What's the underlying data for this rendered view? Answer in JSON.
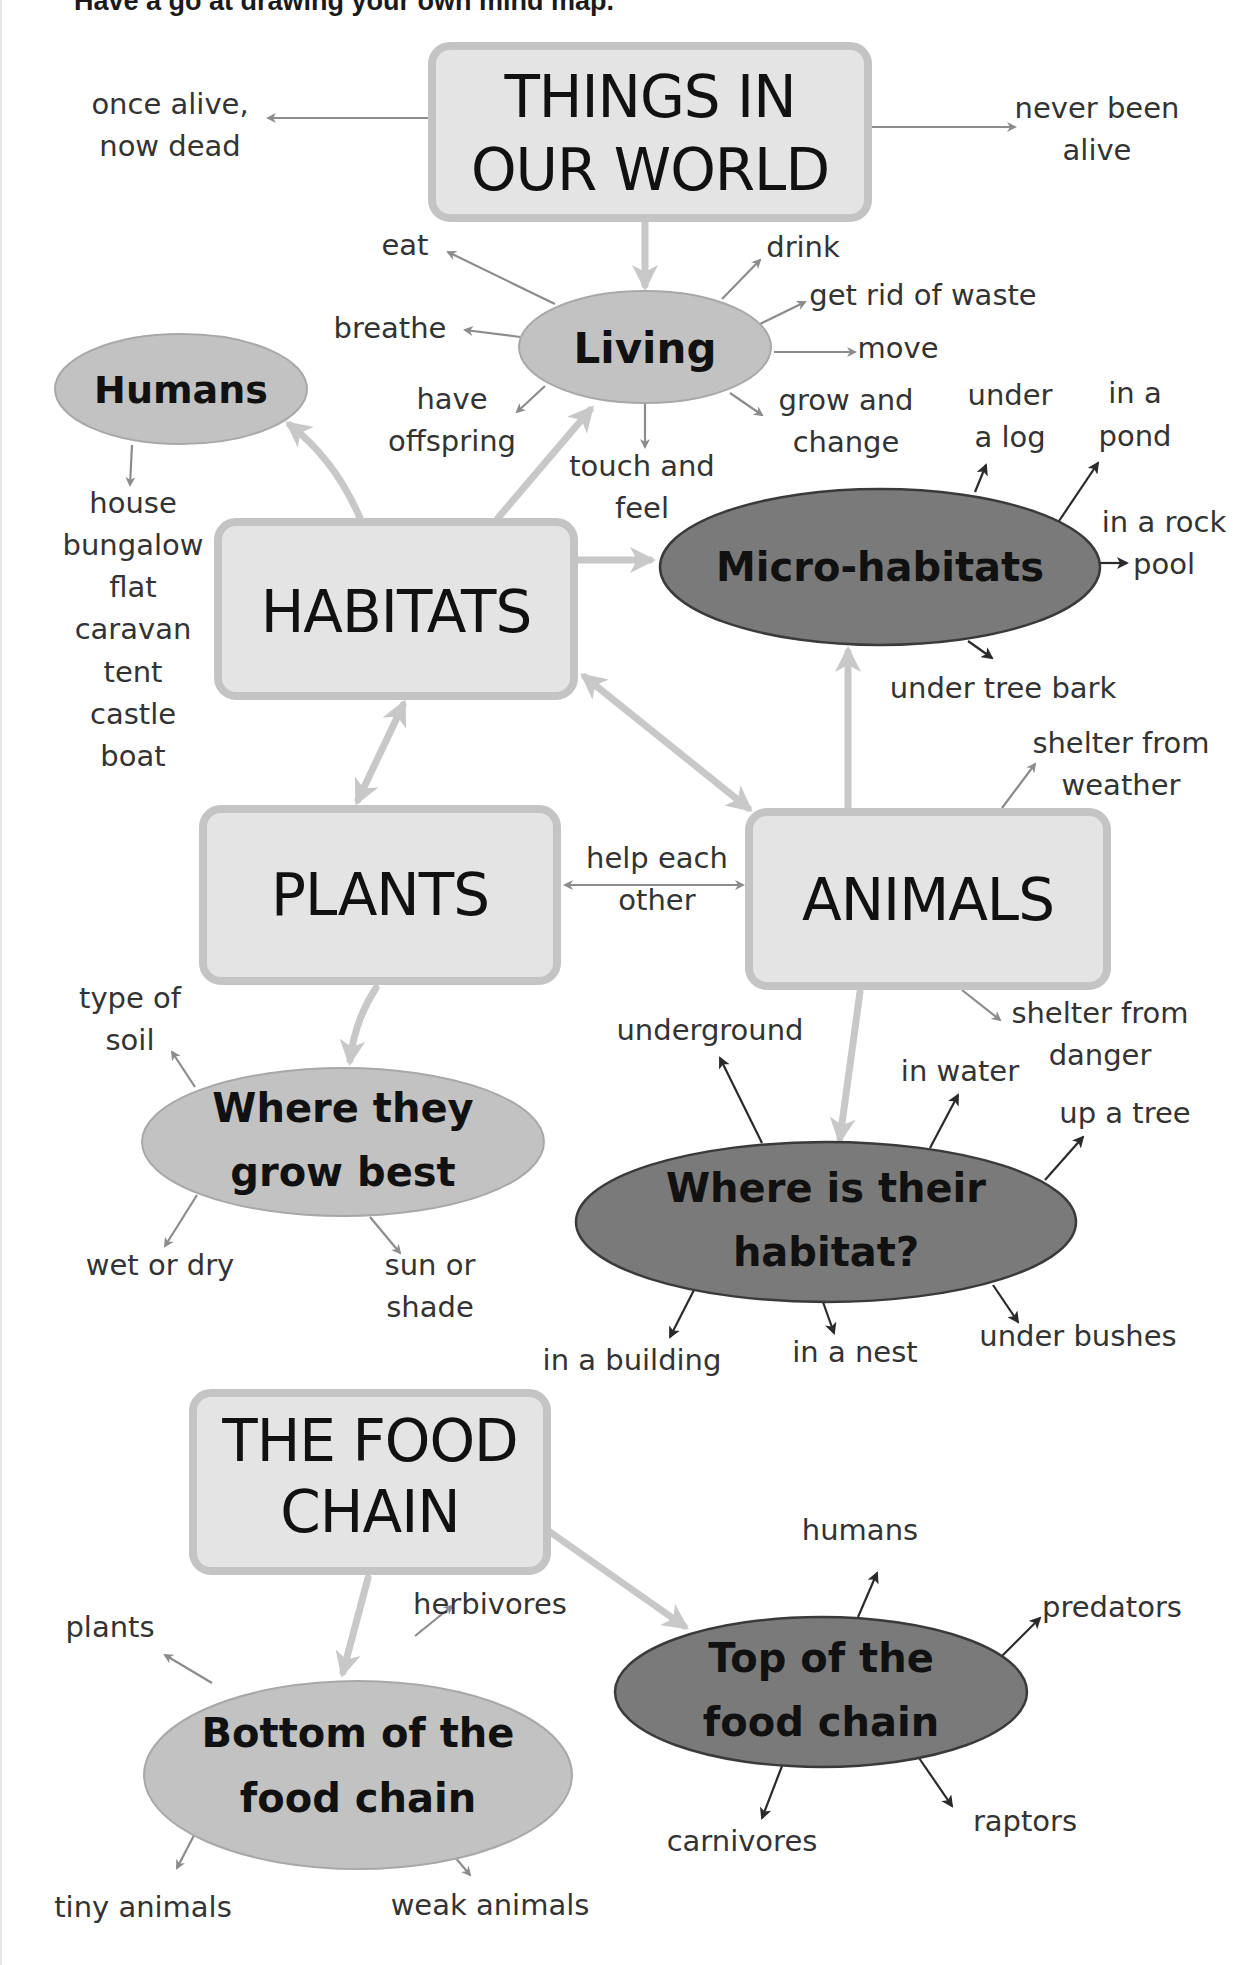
{
  "header": {
    "title": "Have a go at drawing your own mind map."
  },
  "colors": {
    "box_fill": "#e4e4e4",
    "box_border": "#c4c4c4",
    "ellipse_light": "#c2c2c2",
    "ellipse_dark": "#7a7a7a",
    "connector": "#c8c8c8",
    "thin_arrow_gray": "#8c8c8c",
    "thin_arrow_dark": "#2a2a2a",
    "text": "#1a1a1a"
  },
  "nodes": {
    "things": {
      "line1": "THINGS IN",
      "line2": "OUR WORLD"
    },
    "living": {
      "label": "Living"
    },
    "humans": {
      "label": "Humans"
    },
    "habitats": {
      "label": "HABITATS"
    },
    "micro": {
      "label": "Micro-habitats"
    },
    "plants": {
      "label": "PLANTS"
    },
    "animals": {
      "label": "ANIMALS"
    },
    "grow_best": {
      "line1": "Where they",
      "line2": "grow best"
    },
    "their_habitat": {
      "line1": "Where is their",
      "line2": "habitat?"
    },
    "food_chain": {
      "line1": "THE FOOD",
      "line2": "CHAIN"
    },
    "bottom": {
      "line1": "Bottom of the",
      "line2": "food chain"
    },
    "top": {
      "line1": "Top of the",
      "line2": "food chain"
    }
  },
  "leaves": {
    "once_alive": [
      "once alive,",
      "now dead"
    ],
    "never_alive": [
      "never been",
      "alive"
    ],
    "eat": "eat",
    "drink": "drink",
    "breathe": "breathe",
    "waste": "get rid of waste",
    "move": "move",
    "offspring": [
      "have",
      "offspring"
    ],
    "touch": [
      "touch and",
      "feel"
    ],
    "grow_change": [
      "grow and",
      "change"
    ],
    "human_homes": [
      "house",
      "bungalow",
      "flat",
      "caravan",
      "tent",
      "castle",
      "boat"
    ],
    "under_log": [
      "under",
      "a log"
    ],
    "in_pond": [
      "in a",
      "pond"
    ],
    "rock_pool": [
      "in a rock",
      "pool"
    ],
    "tree_bark": "under tree bark",
    "shelter_weather": [
      "shelter from",
      "weather"
    ],
    "help_each": [
      "help each",
      "other"
    ],
    "shelter_danger": [
      "shelter from",
      "danger"
    ],
    "type_soil": [
      "type of",
      "soil"
    ],
    "wet_dry": "wet or dry",
    "sun_shade": [
      "sun or",
      "shade"
    ],
    "underground": "underground",
    "in_water": "in water",
    "up_tree": "up a tree",
    "in_building": "in a building",
    "in_nest": "in a nest",
    "under_bushes": "under bushes",
    "plants": "plants",
    "herbivores": "herbivores",
    "tiny_animals": "tiny animals",
    "weak_animals": "weak animals",
    "humans": "humans",
    "predators": "predators",
    "carnivores": "carnivores",
    "raptors": "raptors"
  }
}
